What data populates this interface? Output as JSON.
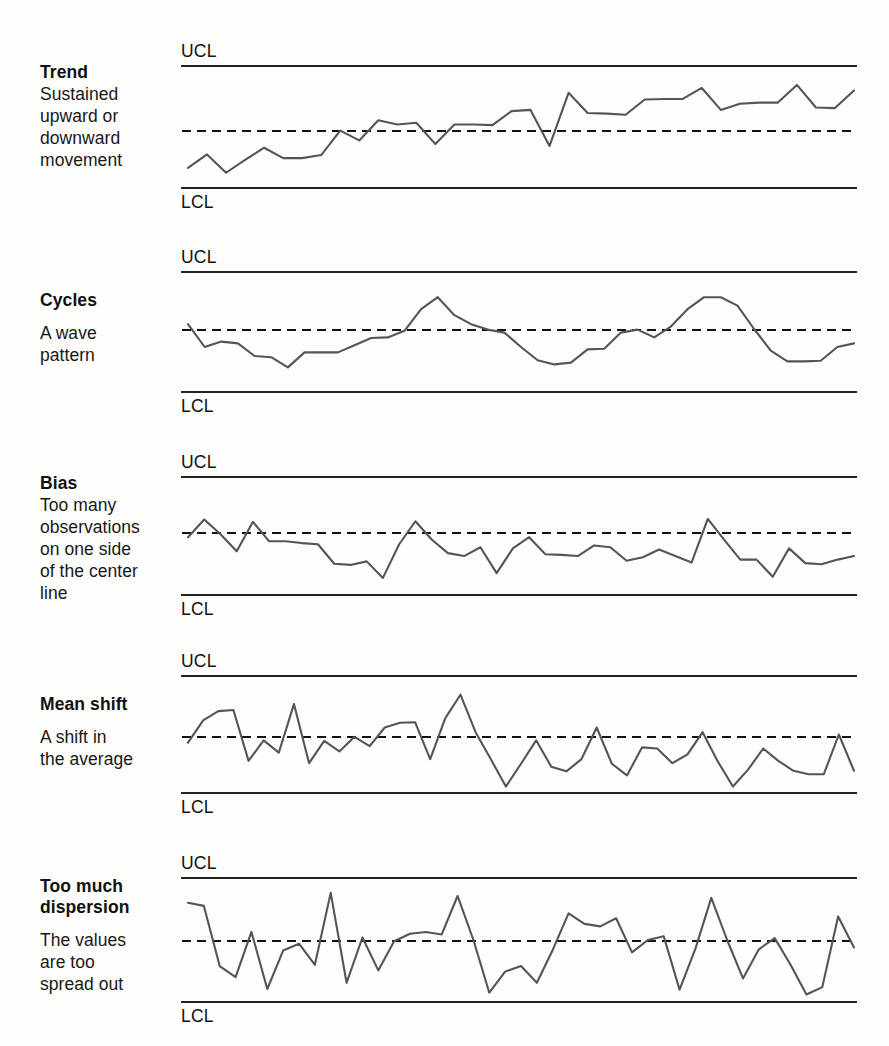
{
  "figure": {
    "background_color": "#fdfdfc",
    "limit_line_color": "#222222",
    "center_line_color": "#111111",
    "data_line_color": "#555555",
    "text_color": "#111111"
  },
  "labels": {
    "ucl": "UCL",
    "lcl": "LCL"
  },
  "panels": [
    {
      "id": "trend",
      "title": "Trend",
      "description": "Sustained\nupward or\ndownward\nmovement",
      "geometry": {
        "top": 40,
        "ucl_y": 66,
        "center_y": 131,
        "lcl_y": 188,
        "label_top": 62
      }
    },
    {
      "id": "cycles",
      "title": "Cycles",
      "description": "A wave\npattern",
      "geometry": {
        "top": 246,
        "ucl_y": 272,
        "center_y": 330,
        "lcl_y": 392,
        "label_top": 290
      }
    },
    {
      "id": "bias",
      "title": "Bias",
      "description": "Too many\nobservations\non one side\nof the center\nline",
      "geometry": {
        "top": 451,
        "ucl_y": 477,
        "center_y": 533,
        "lcl_y": 595,
        "label_top": 473
      }
    },
    {
      "id": "mean-shift",
      "title": "Mean shift",
      "description": "A shift in\nthe average",
      "geometry": {
        "top": 650,
        "ucl_y": 676,
        "center_y": 737,
        "lcl_y": 793,
        "label_top": 694
      }
    },
    {
      "id": "too-much-dispersion",
      "title": "Too much\ndispersion",
      "description": "The values\nare too\nspread out",
      "geometry": {
        "top": 852,
        "ucl_y": 878,
        "center_y": 941,
        "lcl_y": 1002,
        "label_top": 876
      }
    }
  ],
  "chart_data": [
    {
      "type": "line",
      "title": "Trend",
      "subtitle": "Sustained upward or downward movement",
      "xlabel": "",
      "ylabel": "",
      "grid": false,
      "legend": "none",
      "ylim": [
        0,
        1
      ],
      "reference_lines": [
        {
          "name": "UCL",
          "value": 1.0,
          "style": "solid"
        },
        {
          "name": "center",
          "value": 0.535,
          "style": "dashed"
        },
        {
          "name": "LCL",
          "value": 0.0,
          "style": "solid"
        }
      ],
      "values": [
        0.165,
        0.275,
        0.125,
        0.23,
        0.33,
        0.245,
        0.245,
        0.27,
        0.47,
        0.39,
        0.555,
        0.52,
        0.535,
        0.36,
        0.52,
        0.52,
        0.515,
        0.63,
        0.64,
        0.345,
        0.78,
        0.615,
        0.61,
        0.6,
        0.725,
        0.73,
        0.73,
        0.82,
        0.64,
        0.69,
        0.7,
        0.7,
        0.845,
        0.66,
        0.655,
        0.8
      ]
    },
    {
      "type": "line",
      "title": "Cycles",
      "subtitle": "A wave pattern",
      "xlabel": "",
      "ylabel": "",
      "grid": false,
      "legend": "none",
      "ylim": [
        0,
        1
      ],
      "reference_lines": [
        {
          "name": "UCL",
          "value": 1.0,
          "style": "solid"
        },
        {
          "name": "center",
          "value": 0.5,
          "style": "dashed"
        },
        {
          "name": "LCL",
          "value": 0.0,
          "style": "solid"
        }
      ],
      "values": [
        0.565,
        0.375,
        0.42,
        0.405,
        0.3,
        0.29,
        0.205,
        0.33,
        0.33,
        0.33,
        0.39,
        0.45,
        0.455,
        0.51,
        0.69,
        0.79,
        0.64,
        0.565,
        0.52,
        0.495,
        0.375,
        0.265,
        0.23,
        0.245,
        0.355,
        0.36,
        0.495,
        0.52,
        0.455,
        0.545,
        0.69,
        0.79,
        0.79,
        0.72,
        0.525,
        0.345,
        0.255,
        0.255,
        0.26,
        0.375,
        0.405
      ]
    },
    {
      "type": "line",
      "title": "Bias",
      "subtitle": "Too many observations on one side of the center line",
      "xlabel": "",
      "ylabel": "",
      "grid": false,
      "legend": "none",
      "ylim": [
        0,
        1
      ],
      "reference_lines": [
        {
          "name": "UCL",
          "value": 1.0,
          "style": "solid"
        },
        {
          "name": "center",
          "value": 0.53,
          "style": "dashed"
        },
        {
          "name": "LCL",
          "value": 0.0,
          "style": "solid"
        }
      ],
      "values": [
        0.49,
        0.64,
        0.515,
        0.37,
        0.62,
        0.455,
        0.455,
        0.44,
        0.43,
        0.265,
        0.255,
        0.285,
        0.145,
        0.43,
        0.625,
        0.47,
        0.355,
        0.33,
        0.405,
        0.185,
        0.395,
        0.49,
        0.345,
        0.34,
        0.33,
        0.42,
        0.405,
        0.29,
        0.32,
        0.385,
        0.33,
        0.275,
        0.645,
        0.47,
        0.3,
        0.3,
        0.155,
        0.395,
        0.27,
        0.26,
        0.3,
        0.33
      ]
    },
    {
      "type": "line",
      "title": "Mean shift",
      "subtitle": "A shift in the average",
      "xlabel": "",
      "ylabel": "",
      "grid": false,
      "legend": "none",
      "ylim": [
        0,
        1
      ],
      "reference_lines": [
        {
          "name": "UCL",
          "value": 1.0,
          "style": "solid"
        },
        {
          "name": "center",
          "value": 0.52,
          "style": "dashed"
        },
        {
          "name": "LCL",
          "value": 0.0,
          "style": "solid"
        }
      ],
      "values": [
        0.43,
        0.62,
        0.7,
        0.71,
        0.275,
        0.45,
        0.345,
        0.76,
        0.255,
        0.445,
        0.355,
        0.48,
        0.4,
        0.56,
        0.6,
        0.605,
        0.29,
        0.64,
        0.84,
        0.52,
        0.29,
        0.055,
        0.25,
        0.45,
        0.225,
        0.185,
        0.29,
        0.56,
        0.25,
        0.15,
        0.39,
        0.38,
        0.255,
        0.33,
        0.52,
        0.27,
        0.055,
        0.2,
        0.38,
        0.275,
        0.19,
        0.16,
        0.16,
        0.5,
        0.19
      ]
    },
    {
      "type": "line",
      "title": "Too much dispersion",
      "subtitle": "The values are too spread out",
      "xlabel": "",
      "ylabel": "",
      "grid": false,
      "legend": "none",
      "ylim": [
        0,
        1
      ],
      "reference_lines": [
        {
          "name": "UCL",
          "value": 1.0,
          "style": "solid"
        },
        {
          "name": "center",
          "value": 0.5,
          "style": "dashed"
        },
        {
          "name": "LCL",
          "value": 0.0,
          "style": "solid"
        }
      ],
      "values": [
        0.8,
        0.775,
        0.29,
        0.2,
        0.565,
        0.105,
        0.415,
        0.47,
        0.3,
        0.88,
        0.155,
        0.52,
        0.255,
        0.49,
        0.55,
        0.565,
        0.545,
        0.855,
        0.5,
        0.075,
        0.245,
        0.29,
        0.155,
        0.42,
        0.715,
        0.63,
        0.61,
        0.675,
        0.4,
        0.5,
        0.53,
        0.1,
        0.43,
        0.84,
        0.5,
        0.19,
        0.425,
        0.515,
        0.3,
        0.06,
        0.12,
        0.69,
        0.44
      ]
    }
  ]
}
